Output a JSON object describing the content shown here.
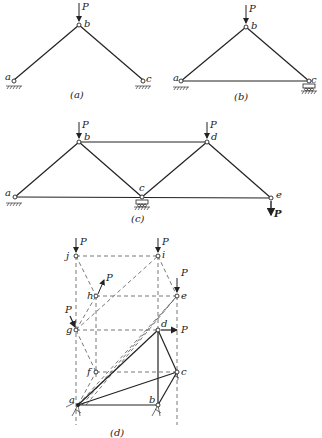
{
  "figure": {
    "panels": [
      {
        "id": "a",
        "caption": "(a)",
        "joints": [
          "a",
          "b",
          "c"
        ],
        "load": "P"
      },
      {
        "id": "b",
        "caption": "(b)",
        "joints": [
          "a",
          "b",
          "c"
        ],
        "load": "P"
      },
      {
        "id": "c",
        "caption": "(c)",
        "joints": [
          "a",
          "b",
          "c",
          "d",
          "e"
        ],
        "loads": [
          "P",
          "P",
          "P"
        ]
      },
      {
        "id": "d",
        "caption": "(d)",
        "joints": [
          "a",
          "b",
          "c",
          "d",
          "e",
          "f",
          "g",
          "h",
          "i",
          "j"
        ],
        "loads": [
          "P",
          "P",
          "P",
          "P",
          "P",
          "P"
        ]
      }
    ]
  },
  "labels": {
    "P": "P",
    "a": "a",
    "b": "b",
    "c": "c",
    "d": "d",
    "e": "e",
    "f": "f",
    "g": "g",
    "h": "h",
    "i": "i",
    "j": "j"
  },
  "captions": {
    "a": "(a)",
    "b": "(b)",
    "c": "(c)",
    "d": "(d)"
  }
}
